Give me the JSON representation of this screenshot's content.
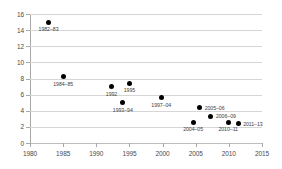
{
  "chart_data": {
    "type": "scatter",
    "title": "",
    "xlabel": "",
    "ylabel": "",
    "xlim": [
      1980,
      2015
    ],
    "ylim": [
      0,
      16
    ],
    "grid": "horizontal",
    "legend": "none",
    "x_ticks": [
      1980,
      1985,
      1990,
      1995,
      2000,
      2005,
      2010,
      2015
    ],
    "y_ticks": [
      0,
      2,
      4,
      6,
      8,
      10,
      12,
      14,
      16
    ],
    "marker": {
      "shape": "circle",
      "color": "#000000",
      "size": 5
    },
    "points": [
      {
        "label": "1982–83",
        "x": 1982.8,
        "y": 15.0,
        "label_pos": "below"
      },
      {
        "label": "1984–85",
        "x": 1985.0,
        "y": 8.2,
        "label_pos": "below"
      },
      {
        "label": "1992",
        "x": 1992.3,
        "y": 7.0,
        "label_pos": "below"
      },
      {
        "label": "1995",
        "x": 1995.0,
        "y": 7.4,
        "label_pos": "below"
      },
      {
        "label": "1993–94",
        "x": 1994.0,
        "y": 5.0,
        "label_pos": "below"
      },
      {
        "label": "1997–04",
        "x": 1999.8,
        "y": 5.6,
        "label_pos": "below"
      },
      {
        "label": "2005–06",
        "x": 2005.6,
        "y": 4.4,
        "label_pos": "right"
      },
      {
        "label": "2004–05",
        "x": 2004.6,
        "y": 2.6,
        "label_pos": "below"
      },
      {
        "label": "2006–09",
        "x": 2007.3,
        "y": 3.3,
        "label_pos": "right"
      },
      {
        "label": "2010–11",
        "x": 2009.9,
        "y": 2.6,
        "label_pos": "below"
      },
      {
        "label": "2011–13",
        "x": 2011.4,
        "y": 2.4,
        "label_pos": "right"
      }
    ]
  }
}
